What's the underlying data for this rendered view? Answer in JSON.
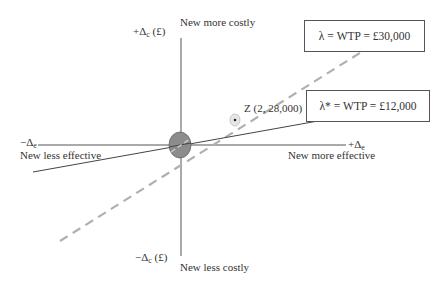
{
  "diagram": {
    "type": "cost-effectiveness plane",
    "axes": {
      "y_positive": {
        "symbol": "+Δ",
        "sub": "c",
        "unit": " (£)",
        "caption": "New more costly"
      },
      "y_negative": {
        "symbol": "−Δ",
        "sub": "c",
        "unit": " (£)",
        "caption": "New less costly"
      },
      "x_positive": {
        "symbol": "+Δ",
        "sub": "e",
        "caption": "New more effective"
      },
      "x_negative": {
        "symbol": "−Δ",
        "sub": "e",
        "caption": "New less effective"
      }
    },
    "thresholds": [
      {
        "label": "λ = WTP = £30,000",
        "style": "dashed",
        "color": "#aaaaaa"
      },
      {
        "label": "λ* = WTP = £12,000",
        "style": "solid",
        "color": "#333333"
      }
    ],
    "point": {
      "label": "Z (2, 28,000)",
      "x": 2,
      "y": 28000
    },
    "origin_marker_color": "#8a8a8a"
  }
}
